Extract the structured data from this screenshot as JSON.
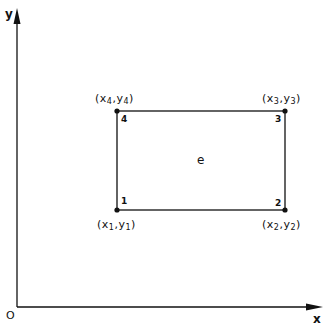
{
  "diagram": {
    "axes": {
      "x_label": "x",
      "y_label": "y",
      "origin_label": "O"
    },
    "element": {
      "label": "e",
      "nodes": [
        {
          "id": "1",
          "coord_label": {
            "open": "(",
            "x": "x",
            "x_sub": "1",
            "sep": ",",
            "y": "y",
            "y_sub": "1",
            "close": ")"
          }
        },
        {
          "id": "2",
          "coord_label": {
            "open": "(",
            "x": "x",
            "x_sub": "2",
            "sep": ",",
            "y": "y",
            "y_sub": "2",
            "close": ")"
          }
        },
        {
          "id": "3",
          "coord_label": {
            "open": "(",
            "x": "x",
            "x_sub": "3",
            "sep": ",",
            "y": "y",
            "y_sub": "3",
            "close": ")"
          }
        },
        {
          "id": "4",
          "coord_label": {
            "open": "(",
            "x": "x",
            "x_sub": "4",
            "sep": ",",
            "y": "y",
            "y_sub": "4",
            "close": ")"
          }
        }
      ]
    },
    "colors": {
      "line": "#111111",
      "background": "#ffffff"
    }
  }
}
